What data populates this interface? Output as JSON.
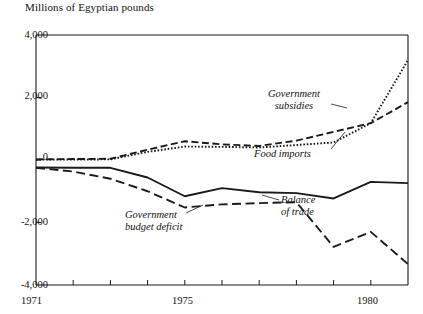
{
  "chart_data": {
    "type": "line",
    "title": "Millions of Egyptian pounds",
    "xlabel": "",
    "ylabel": "Millions of Egyptian pounds",
    "xlim": [
      1971,
      1981
    ],
    "ylim": [
      -4000,
      4000
    ],
    "grid": false,
    "legend_position": "inline-annotations",
    "x": [
      1971,
      1972,
      1973,
      1974,
      1975,
      1976,
      1977,
      1978,
      1979,
      1980,
      1981
    ],
    "xticks": [
      1971,
      1972,
      1973,
      1974,
      1975,
      1976,
      1977,
      1978,
      1979,
      1980,
      1981
    ],
    "xtick_labels": [
      "1971",
      "",
      "",
      "",
      "1975",
      "",
      "",
      "",
      "",
      "1980",
      ""
    ],
    "yticks": [
      -4000,
      -2000,
      0,
      2000,
      4000
    ],
    "ytick_labels": [
      "-4,000",
      "-2,000",
      "0",
      "2,000",
      "4,000"
    ],
    "series": [
      {
        "name": "Government subsidies",
        "style": "dashed",
        "values": [
          20,
          30,
          40,
          330,
          600,
          500,
          450,
          620,
          900,
          1180,
          1850
        ]
      },
      {
        "name": "Food imports",
        "style": "dotted",
        "values": [
          10,
          15,
          20,
          260,
          430,
          420,
          400,
          480,
          560,
          1180,
          3200
        ]
      },
      {
        "name": "Balance of trade",
        "style": "solid",
        "values": [
          -240,
          -250,
          -250,
          -560,
          -1160,
          -900,
          -1030,
          -1060,
          -1230,
          -700,
          -740
        ]
      },
      {
        "name": "Government budget deficit",
        "style": "long-dashed",
        "values": [
          -250,
          -370,
          -600,
          -1000,
          -1520,
          -1420,
          -1380,
          -1350,
          -2780,
          -2300,
          -3330
        ]
      }
    ],
    "annotations": [
      {
        "text_line1": "Government",
        "text_line2": "subsidies",
        "target_series": "Government subsidies"
      },
      {
        "text_line1": "Food imports",
        "text_line2": "",
        "target_series": "Food imports"
      },
      {
        "text_line1": "Balance",
        "text_line2": "of trade",
        "target_series": "Balance of trade"
      },
      {
        "text_line1": "Government",
        "text_line2": "budget deficit",
        "target_series": "Government budget deficit"
      }
    ],
    "colors": {
      "ink": "#1a1a1a",
      "background": "#ffffff"
    }
  }
}
